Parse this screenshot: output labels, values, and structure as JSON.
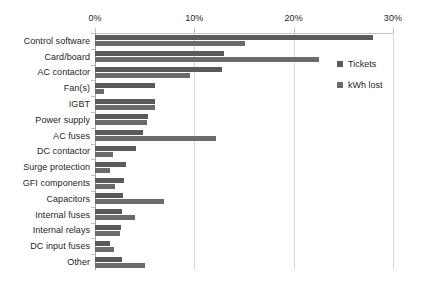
{
  "chart_data": {
    "type": "bar",
    "orientation": "horizontal",
    "title": "",
    "xlabel": "",
    "ylabel": "",
    "xlim": [
      0,
      30
    ],
    "xticks": [
      0,
      10,
      20,
      30
    ],
    "xtick_labels": [
      "0%",
      "10%",
      "20%",
      "30%"
    ],
    "grid": true,
    "grid_axis": "x",
    "legend_position": "right",
    "categories": [
      "Control software",
      "Card/board",
      "AC contactor",
      "Fan(s)",
      "IGBT",
      "Power supply",
      "AC fuses",
      "DC contactor",
      "Surge protection",
      "GFI components",
      "Capacitors",
      "Internal fuses",
      "Internal relays",
      "DC input fuses",
      "Other"
    ],
    "series": [
      {
        "name": "Tickets",
        "color": "#5a5a5a",
        "values": [
          28.0,
          13.0,
          12.8,
          6.0,
          6.0,
          5.3,
          4.8,
          4.1,
          3.1,
          2.9,
          2.8,
          2.7,
          2.6,
          1.5,
          2.7
        ]
      },
      {
        "name": "kWh lost",
        "color": "#6b6b6b",
        "values": [
          15.1,
          22.5,
          9.6,
          0.9,
          6.0,
          5.2,
          12.2,
          1.8,
          1.5,
          2.0,
          6.9,
          4.0,
          2.5,
          1.9,
          5.0
        ]
      }
    ]
  },
  "legend": {
    "items": [
      {
        "label": "Tickets"
      },
      {
        "label": "kWh lost"
      }
    ]
  }
}
